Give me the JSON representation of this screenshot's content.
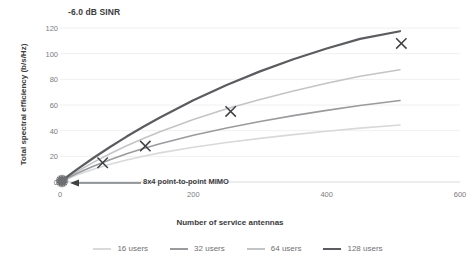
{
  "chart_data": {
    "type": "line",
    "title": "-6.0 dB SINR",
    "xlabel": "Number of service antennas",
    "ylabel": "Total spectral efficiency (b/s/Hz)",
    "xlim": [
      0,
      600
    ],
    "ylim": [
      0,
      120
    ],
    "xticks": [
      0,
      200,
      400,
      600
    ],
    "yticks": [
      0,
      20,
      40,
      60,
      80,
      100,
      120
    ],
    "grid": "horizontal",
    "legend_position": "bottom",
    "x": [
      0,
      25,
      50,
      75,
      100,
      125,
      150,
      200,
      250,
      300,
      350,
      400,
      450,
      510
    ],
    "series": [
      {
        "name": "16 users",
        "color": "#d8d9db",
        "width": 1.6,
        "values": [
          0,
          5.5,
          10.0,
          13.9,
          17.2,
          20.1,
          22.7,
          27.1,
          30.8,
          34.0,
          36.9,
          39.5,
          42.0,
          44.4
        ]
      },
      {
        "name": "32 users",
        "color": "#9a9b9e",
        "width": 1.6,
        "values": [
          0,
          6.6,
          12.3,
          17.4,
          22.0,
          26.1,
          29.8,
          36.4,
          42.1,
          47.2,
          51.7,
          55.8,
          59.6,
          63.5
        ]
      },
      {
        "name": "64 users",
        "color": "#c3c4c7",
        "width": 1.6,
        "values": [
          0,
          8.0,
          15.3,
          22.0,
          28.2,
          33.9,
          39.2,
          48.7,
          57.0,
          64.3,
          70.9,
          76.9,
          82.4,
          87.5
        ]
      },
      {
        "name": "128 users",
        "color": "#5b5c5f",
        "width": 2.2,
        "values": [
          0,
          9.6,
          18.7,
          27.3,
          35.4,
          43.1,
          50.3,
          63.7,
          75.6,
          86.2,
          95.6,
          104.0,
          111.5,
          117.5
        ]
      }
    ],
    "markers": [
      {
        "label": "x-marker-64",
        "x": 64,
        "y": 15
      },
      {
        "label": "x-marker-128",
        "x": 128,
        "y": 28
      },
      {
        "label": "x-marker-256",
        "x": 256,
        "y": 55
      },
      {
        "label": "x-marker-512",
        "x": 512,
        "y": 108
      }
    ],
    "annotations": [
      {
        "text": "8x4 point-to-point MIMO",
        "target_x": 0,
        "target_y": 0,
        "marker": "origin-cluster-dot"
      }
    ]
  }
}
